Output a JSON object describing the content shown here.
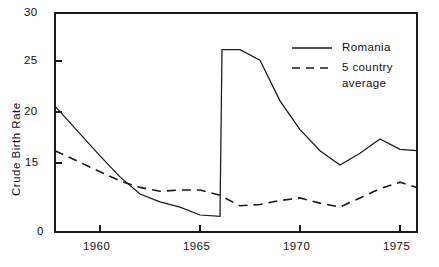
{
  "chart_data": {
    "type": "line",
    "title": "",
    "xlabel": "",
    "ylabel": "Crude Birth Rate",
    "xlim": [
      1957.75,
      1975.85
    ],
    "ylim": [
      13.3,
      30.0
    ],
    "grid": false,
    "legend_position": "top-right",
    "x_ticks": [
      1960,
      1965,
      1970,
      1975
    ],
    "x_tick_labels": [
      "1960",
      "1965",
      "1970",
      "1975"
    ],
    "y_ticks": [
      0,
      15,
      20,
      25,
      30
    ],
    "y_tick_labels": [
      "0",
      "15",
      "20",
      "25",
      "30"
    ],
    "y_axis_break": true,
    "series": [
      {
        "name": "Romania",
        "style": "solid",
        "color": "#1a1a1a",
        "x": [
          1957.75,
          1960,
          1961,
          1962,
          1963,
          1964,
          1965,
          1966,
          1966.1,
          1967,
          1968,
          1969,
          1970,
          1971,
          1972,
          1973,
          1974,
          1975,
          1975.85
        ],
        "values": [
          22.9,
          19.1,
          17.5,
          16.2,
          15.6,
          15.2,
          14.6,
          14.5,
          27.2,
          27.2,
          26.4,
          23.3,
          21.1,
          19.5,
          18.4,
          19.3,
          20.4,
          19.6,
          19.5
        ]
      },
      {
        "name": "5 country average",
        "style": "dashed",
        "color": "#1a1a1a",
        "x": [
          1957.75,
          1960,
          1961,
          1962,
          1963,
          1964,
          1965,
          1966,
          1967,
          1968,
          1969,
          1970,
          1971,
          1972,
          1973,
          1974,
          1975,
          1975.85
        ],
        "values": [
          19.5,
          17.9,
          17.2,
          16.7,
          16.4,
          16.5,
          16.5,
          16.1,
          15.3,
          15.4,
          15.7,
          15.9,
          15.5,
          15.2,
          15.9,
          16.6,
          17.1,
          16.7
        ]
      }
    ]
  },
  "axes": {
    "y_label": "Crude Birth Rate",
    "y_tick_labels": [
      "30",
      "25",
      "20",
      "15",
      "0"
    ],
    "x_tick_labels": [
      "1960",
      "1965",
      "1970",
      "1975"
    ]
  },
  "legend": {
    "entries": [
      {
        "label": "Romania",
        "style": "solid"
      },
      {
        "label": "5 country",
        "label2": "average",
        "style": "dashed"
      }
    ],
    "romania_label": "Romania",
    "average_label_line1": "5 country",
    "average_label_line2": "average"
  },
  "colors": {
    "line": "#1a1a1a",
    "axis": "#1a1a1a",
    "background": "#ffffff"
  }
}
